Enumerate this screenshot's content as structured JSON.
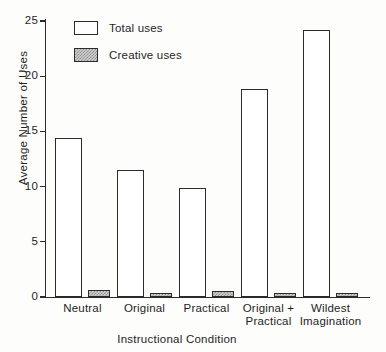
{
  "chart_data": {
    "type": "bar",
    "title": "",
    "xlabel": "Instructional Condition",
    "ylabel": "Average Number of Uses",
    "categories": [
      "Neutral",
      "Original",
      "Practical",
      "Original +\nPractical",
      "Wildest\nImagination"
    ],
    "series": [
      {
        "name": "Total uses",
        "values": [
          14.4,
          11.5,
          9.9,
          18.8,
          24.2
        ]
      },
      {
        "name": "Creative uses",
        "values": [
          0.6,
          0.25,
          0.55,
          0.4,
          0.35
        ]
      }
    ],
    "ylim": [
      0,
      25
    ],
    "yticks": [
      0,
      5,
      10,
      15,
      20,
      25
    ],
    "ytick_labels": [
      "0",
      "5",
      "10",
      "15",
      "20",
      "25"
    ],
    "grid": false,
    "legend": {
      "position": "top-left",
      "entries": [
        {
          "label": "Total uses",
          "swatch": "open-rectangle",
          "fill": "#ffffff"
        },
        {
          "label": "Creative uses",
          "swatch": "stippled-rectangle",
          "fill": "#d2d2d2"
        }
      ]
    },
    "colors": {
      "total_uses_fill": "#ffffff",
      "creative_uses_fill": "#d2d2d2",
      "outline": "#2b2b2b",
      "background": "#fdfdfc"
    }
  }
}
